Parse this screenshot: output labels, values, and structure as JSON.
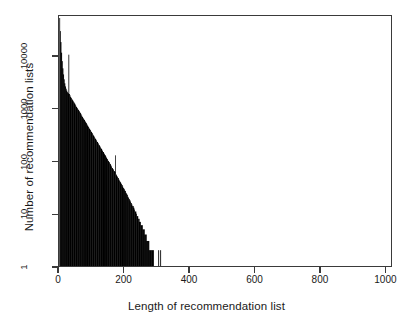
{
  "chart_data": {
    "type": "bar",
    "title": "",
    "subtitle": "",
    "xlabel": "Length of recommendation list",
    "ylabel": "Number of recommendation lists",
    "yscale": "log",
    "xscale": "linear",
    "xlim": [
      0,
      1020
    ],
    "ylim": [
      1,
      60000
    ],
    "grid": false,
    "legend": null,
    "xticks": [
      0,
      200,
      400,
      600,
      800,
      1000
    ],
    "xtick_labels": [
      "0",
      "200",
      "400",
      "600",
      "800",
      "1000"
    ],
    "yticks": [
      1,
      10,
      100,
      1000,
      10000
    ],
    "ytick_labels": [
      "1",
      "10",
      "100",
      "1000",
      "10000"
    ],
    "bin_width": 2,
    "bar_color": "#000000",
    "frame_color": "#3a3a3a",
    "background": "#ffffff",
    "x": [
      2,
      4,
      6,
      8,
      10,
      12,
      14,
      16,
      18,
      20,
      22,
      24,
      26,
      28,
      30,
      32,
      34,
      36,
      38,
      40,
      42,
      44,
      46,
      48,
      50,
      52,
      54,
      56,
      58,
      60,
      62,
      64,
      66,
      68,
      70,
      72,
      74,
      76,
      78,
      80,
      82,
      84,
      86,
      88,
      90,
      92,
      94,
      96,
      98,
      100,
      102,
      104,
      106,
      108,
      110,
      112,
      114,
      116,
      118,
      120,
      122,
      124,
      126,
      128,
      130,
      132,
      134,
      136,
      138,
      140,
      142,
      144,
      146,
      148,
      150,
      152,
      154,
      156,
      158,
      160,
      162,
      164,
      166,
      168,
      170,
      172,
      174,
      176,
      178,
      180,
      182,
      184,
      186,
      188,
      190,
      192,
      194,
      196,
      198,
      200,
      202,
      204,
      206,
      208,
      210,
      212,
      214,
      216,
      218,
      220,
      222,
      224,
      226,
      228,
      230,
      232,
      234,
      236,
      238,
      240,
      242,
      244,
      246,
      248,
      250,
      252,
      254,
      256,
      258,
      260,
      262,
      264,
      266,
      268,
      270,
      272,
      274,
      276,
      278,
      280,
      282,
      284,
      286,
      288,
      290,
      292,
      294,
      296,
      298,
      300,
      306,
      312,
      318,
      326,
      334,
      342,
      350,
      358,
      366,
      374,
      382,
      390,
      398,
      406,
      414,
      520,
      975
    ],
    "values": [
      55000,
      31000,
      19000,
      12000,
      8200,
      6000,
      4600,
      3700,
      3100,
      2700,
      2450,
      2250,
      2100,
      2000,
      11000,
      1950,
      1820,
      1700,
      1620,
      1540,
      1470,
      1400,
      1340,
      1280,
      1220,
      1160,
      1100,
      1050,
      1000,
      950,
      910,
      870,
      830,
      790,
      750,
      715,
      680,
      650,
      620,
      590,
      560,
      535,
      510,
      485,
      462,
      440,
      420,
      400,
      381,
      363,
      346,
      330,
      314,
      299,
      285,
      272,
      259,
      247,
      235,
      224,
      213,
      203,
      193,
      184,
      175,
      167,
      159,
      151,
      144,
      137,
      130,
      124,
      118,
      112,
      107,
      102,
      97,
      92,
      88,
      83,
      79,
      75,
      72,
      68,
      65,
      62,
      130,
      56,
      53,
      50,
      48,
      45,
      43,
      41,
      39,
      37,
      35,
      33,
      31,
      30,
      28,
      27,
      25,
      24,
      23,
      21,
      20,
      19,
      18,
      17,
      16,
      15,
      14,
      14,
      13,
      12,
      11,
      11,
      10,
      9,
      9,
      8,
      8,
      7,
      7,
      6,
      6,
      6,
      5,
      5,
      5,
      4,
      4,
      4,
      3,
      3,
      3,
      3,
      2,
      2,
      2,
      2,
      2,
      2,
      2,
      1,
      1,
      1,
      1,
      1,
      2,
      2,
      1,
      1,
      1,
      1,
      1,
      1,
      1,
      1,
      1,
      1,
      1,
      1,
      1,
      1,
      1
    ]
  }
}
